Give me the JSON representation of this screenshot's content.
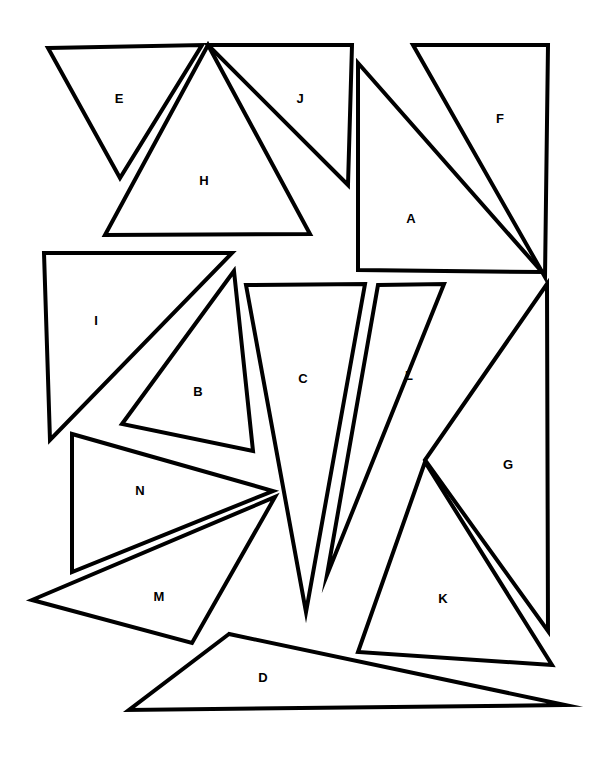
{
  "figure": {
    "background_color": "#ffffff",
    "stroke_color": "#000000",
    "fill_color": "#ffffff",
    "stroke_width": 4,
    "canvas_width": 598,
    "canvas_height": 757,
    "shape_count": 14,
    "shape_type": "triangle"
  },
  "shapes": [
    {
      "label": "A",
      "points": "358,63 358,270 542,272",
      "label_x": 411,
      "label_y": 220
    },
    {
      "label": "B",
      "points": "234,271 122,424 253,451",
      "label_x": 198,
      "label_y": 393
    },
    {
      "label": "C",
      "points": "246,285 365,284 306,612",
      "label_x": 303,
      "label_y": 380
    },
    {
      "label": "D",
      "points": "229,634 129,710 565,705",
      "label_x": 263,
      "label_y": 679
    },
    {
      "label": "E",
      "points": "48,48 202,45 120,178",
      "label_x": 119,
      "label_y": 100
    },
    {
      "label": "F",
      "points": "413,45 548,45 545,277",
      "label_x": 500,
      "label_y": 120
    },
    {
      "label": "G",
      "points": "547,284 425,460 548,631",
      "label_x": 508,
      "label_y": 466
    },
    {
      "label": "H",
      "points": "208,45 310,234 105,235",
      "label_x": 204,
      "label_y": 182
    },
    {
      "label": "I",
      "points": "44,253 232,253 50,440",
      "label_x": 96,
      "label_y": 322
    },
    {
      "label": "J",
      "points": "208,45 352,45 348,185",
      "label_x": 300,
      "label_y": 100
    },
    {
      "label": "K",
      "points": "425,462 358,652 552,665",
      "label_x": 443,
      "label_y": 600
    },
    {
      "label": "L",
      "points": "378,285 444,284 327,575",
      "label_x": 409,
      "label_y": 377
    },
    {
      "label": "M",
      "points": "32,600 275,497 192,643",
      "label_x": 159,
      "label_y": 598
    },
    {
      "label": "N",
      "points": "72,434 72,572 273,491",
      "label_x": 140,
      "label_y": 492
    }
  ]
}
